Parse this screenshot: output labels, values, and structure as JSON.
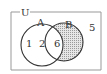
{
  "diagram": {
    "type": "venn",
    "universe_label": "U",
    "sets": [
      {
        "name": "A",
        "label": "A"
      },
      {
        "name": "B",
        "label": "B"
      }
    ],
    "regions": {
      "only_a": [
        "1",
        "2"
      ],
      "a_and_b": [
        "6"
      ],
      "only_b": [],
      "outside": [
        "5"
      ]
    },
    "shaded_region": "B minus A",
    "colors": {
      "stroke": "#333333",
      "shade": "#cfcfcf",
      "frame": "#999999"
    }
  }
}
